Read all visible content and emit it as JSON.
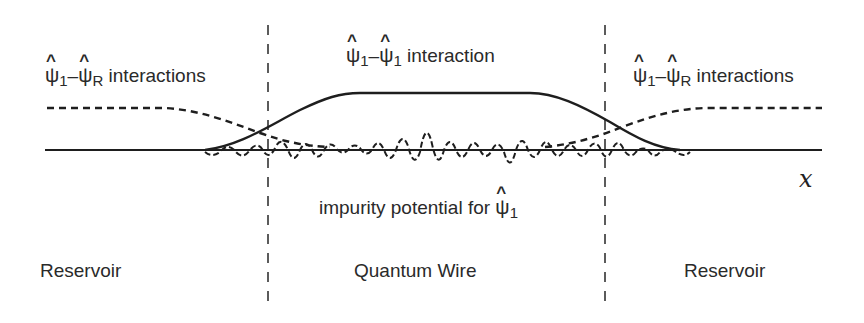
{
  "labels": {
    "left_interaction": {
      "a_sub": "1",
      "sep": "–",
      "b_sub": "R",
      "text": "interactions"
    },
    "center_interaction": {
      "a_sub": "1",
      "sep": "–",
      "b_sub": "1",
      "text": "interaction"
    },
    "right_interaction": {
      "a_sub": "1",
      "sep": "–",
      "b_sub": "R",
      "text": "interactions"
    },
    "impurity": {
      "text": "impurity potential for",
      "sub": "1"
    },
    "psi_symbol": "ψ",
    "hat_symbol": "^",
    "x_axis": "x",
    "regions": [
      "Reservoir",
      "Quantum Wire",
      "Reservoir"
    ]
  },
  "colors": {
    "line": "#1e1e1e",
    "text": "#2a2a2a"
  }
}
